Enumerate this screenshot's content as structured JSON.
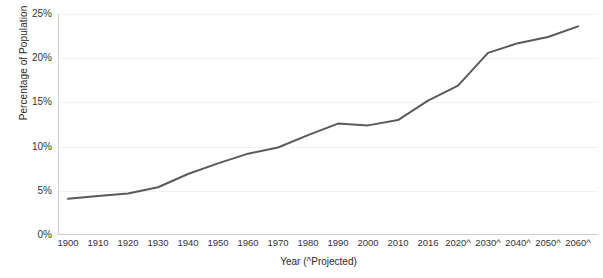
{
  "chart_data": {
    "type": "line",
    "title": "",
    "xlabel": "Year (^Projected)",
    "ylabel": "Percentage of Population",
    "categories": [
      "1900",
      "1910",
      "1920",
      "1930",
      "1940",
      "1950",
      "1960",
      "1970",
      "1980",
      "1990",
      "2000",
      "2010",
      "2016",
      "2020^",
      "2030^",
      "2040^",
      "2050^",
      "2060^"
    ],
    "values": [
      4.1,
      4.4,
      4.7,
      5.4,
      6.9,
      8.1,
      9.2,
      9.9,
      11.3,
      12.6,
      12.4,
      13.0,
      15.2,
      16.9,
      20.6,
      21.7,
      22.4,
      23.6
    ],
    "series": [
      {
        "name": "Percentage of Population",
        "values": [
          4.1,
          4.4,
          4.7,
          5.4,
          6.9,
          8.1,
          9.2,
          9.9,
          11.3,
          12.6,
          12.4,
          13.0,
          15.2,
          16.9,
          20.6,
          21.7,
          22.4,
          23.6
        ]
      }
    ],
    "ylim": [
      0,
      25
    ],
    "ytick_labels": [
      "0%",
      "5%",
      "10%",
      "15%",
      "20%",
      "25%"
    ],
    "ytick_values": [
      0,
      5,
      10,
      15,
      20,
      25
    ],
    "grid": true,
    "legend": "none",
    "line_color": "#5a5a5a",
    "grid_color": "#f2f2f2",
    "axis_color": "#cfcfcf",
    "background": "#ffffff"
  },
  "axes": {
    "y_title": "Percentage of Population",
    "x_title": "Year (^Projected)"
  },
  "title_remnant": ""
}
